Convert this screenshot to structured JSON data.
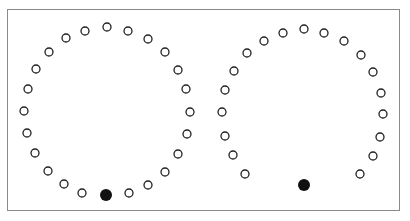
{
  "diagram": {
    "stroke_color": "#222222",
    "fill_color": "#111111",
    "frame_color": "#8a8a8a",
    "open_radius": 4,
    "filled_radius": 6,
    "rings": [
      {
        "name": "left-ring",
        "open_dots": [
          [
            107,
            27
          ],
          [
            128,
            31
          ],
          [
            148,
            39
          ],
          [
            165,
            52
          ],
          [
            178,
            70
          ],
          [
            186,
            89
          ],
          [
            190,
            112
          ],
          [
            187,
            134
          ],
          [
            178,
            154
          ],
          [
            165,
            172
          ],
          [
            148,
            185
          ],
          [
            129,
            193
          ],
          [
            82,
            193
          ],
          [
            64,
            184
          ],
          [
            48,
            171
          ],
          [
            35,
            153
          ],
          [
            27,
            133
          ],
          [
            24,
            111
          ],
          [
            28,
            89
          ],
          [
            36,
            69
          ],
          [
            49,
            52
          ],
          [
            66,
            38
          ],
          [
            85,
            31
          ]
        ],
        "filled_dot": [
          106,
          195
        ]
      },
      {
        "name": "right-ring",
        "open_dots": [
          [
            304,
            29
          ],
          [
            324,
            33
          ],
          [
            344,
            41
          ],
          [
            361,
            55
          ],
          [
            373,
            72
          ],
          [
            381,
            93
          ],
          [
            383,
            114
          ],
          [
            380,
            137
          ],
          [
            373,
            156
          ],
          [
            360,
            174
          ],
          [
            245,
            174
          ],
          [
            233,
            155
          ],
          [
            225,
            136
          ],
          [
            222,
            112
          ],
          [
            225,
            90
          ],
          [
            234,
            71
          ],
          [
            247,
            53
          ],
          [
            264,
            41
          ],
          [
            283,
            33
          ]
        ],
        "filled_dot": [
          304,
          185
        ]
      }
    ]
  }
}
